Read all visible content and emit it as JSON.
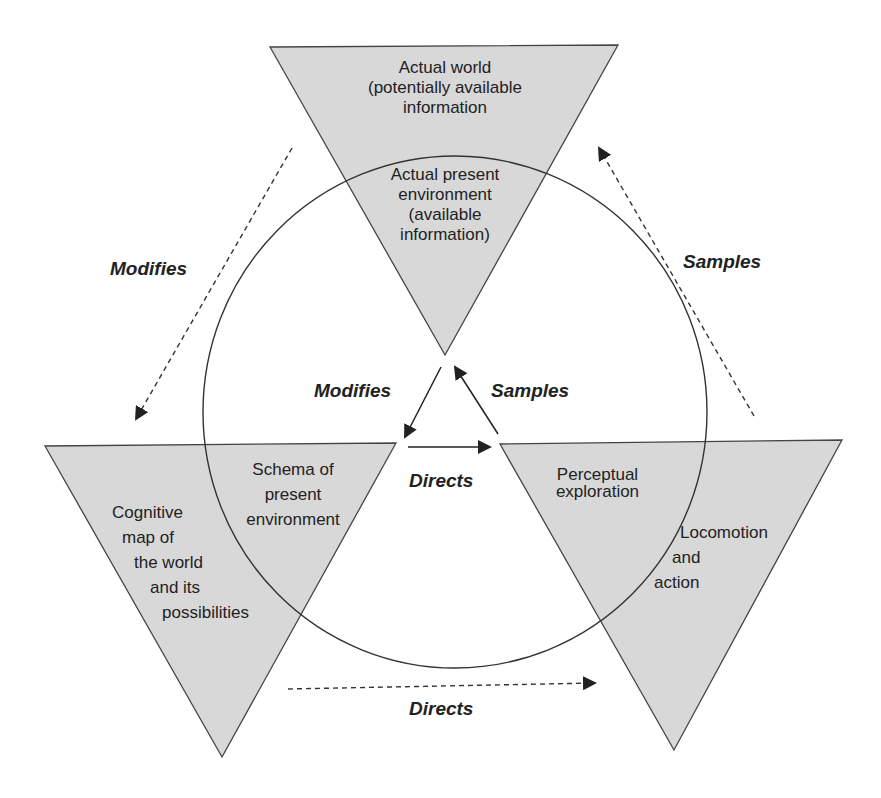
{
  "diagram": {
    "nodes": {
      "top_outer": "Actual world (potentially available information",
      "top_outer_lines": [
        "Actual world",
        "(potentially available",
        "information"
      ],
      "top_inner_lines": [
        "Actual present",
        "environment",
        "(available",
        "information)"
      ],
      "left_outer_lines": [
        "Cognitive",
        "map of",
        "the world",
        "and its",
        "possibilities"
      ],
      "left_inner_lines": [
        "Schema of",
        "present",
        "environment"
      ],
      "right_inner_lines": [
        "Perceptual",
        "exploration"
      ],
      "right_outer_lines": [
        "Locomotion",
        "and",
        "action"
      ]
    },
    "edges": {
      "outer_left": "Modifies",
      "outer_right": "Samples",
      "outer_bottom": "Directs",
      "inner_left": "Modifies",
      "inner_right": "Samples",
      "inner_bottom": "Directs"
    },
    "colors": {
      "triangle_fill": "#d8d8d8",
      "stroke": "#333333",
      "background": "#ffffff"
    }
  }
}
